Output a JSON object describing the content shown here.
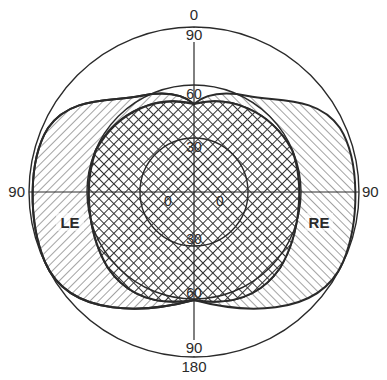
{
  "diagram": {
    "type": "perimetry-visual-field",
    "colors": {
      "line": "#2a2a2a",
      "background": "#ffffff"
    },
    "labels": {
      "top_outer": "0",
      "top_90": "90",
      "top_60": "60",
      "top_30": "30",
      "center_left": "0",
      "center_right": "0",
      "bottom_30": "30",
      "bottom_60": "60",
      "bottom_90": "90",
      "bottom_outer": "180",
      "left_90": "90",
      "right_90": "90",
      "left_eye": "LE",
      "right_eye": "RE"
    },
    "rings_degrees": [
      30,
      60,
      90
    ],
    "regions": [
      {
        "name": "left-eye-field",
        "pattern": "diagonal-hatch",
        "label": "LE"
      },
      {
        "name": "right-eye-field",
        "pattern": "diagonal-hatch",
        "label": "RE"
      },
      {
        "name": "binocular-overlap",
        "pattern": "cross-hatch"
      }
    ]
  }
}
